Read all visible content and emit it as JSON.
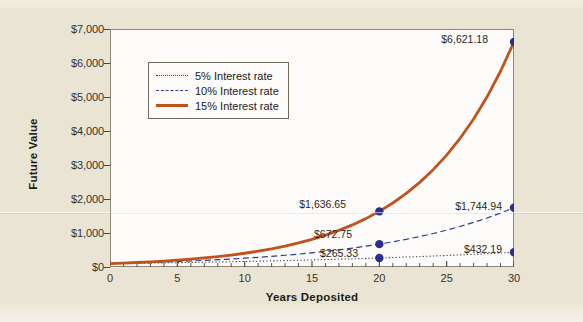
{
  "chart_data": {
    "type": "line",
    "title": "",
    "xlabel": "Years Deposited",
    "ylabel": "Future Value",
    "xlim": [
      0,
      30
    ],
    "ylim": [
      0,
      7000
    ],
    "xticks": [
      0,
      5,
      10,
      15,
      20,
      25,
      30
    ],
    "xtick_labels": [
      "0",
      "5",
      "10",
      "15",
      "20",
      "25",
      "30"
    ],
    "yticks": [
      0,
      1000,
      2000,
      3000,
      4000,
      5000,
      6000,
      7000
    ],
    "ytick_labels": [
      "$0",
      "$1,000",
      "$2,000",
      "$3,000",
      "$4,000",
      "$5,000",
      "$6,000",
      "$7,000"
    ],
    "grid": false,
    "legend_position": "upper left inside",
    "series": [
      {
        "name": "5% Interest rate",
        "rate": 0.05,
        "style": "dotted",
        "color": "#3a3a3a",
        "x": [
          0,
          1,
          2,
          3,
          4,
          5,
          6,
          7,
          8,
          9,
          10,
          11,
          12,
          13,
          14,
          15,
          16,
          17,
          18,
          19,
          20,
          21,
          22,
          23,
          24,
          25,
          26,
          27,
          28,
          29,
          30
        ],
        "values": [
          100,
          105,
          110.25,
          115.76,
          121.55,
          127.63,
          134.01,
          140.71,
          147.75,
          155.13,
          162.89,
          171.03,
          179.59,
          188.56,
          198.0,
          207.89,
          218.29,
          229.2,
          240.66,
          252.7,
          265.33,
          278.6,
          292.53,
          307.15,
          322.51,
          338.64,
          355.57,
          373.35,
          392.01,
          411.61,
          432.19
        ]
      },
      {
        "name": "10% Interest rate",
        "rate": 0.1,
        "style": "dashed",
        "color": "#2f3a95",
        "x": [
          0,
          1,
          2,
          3,
          4,
          5,
          6,
          7,
          8,
          9,
          10,
          11,
          12,
          13,
          14,
          15,
          16,
          17,
          18,
          19,
          20,
          21,
          22,
          23,
          24,
          25,
          26,
          27,
          28,
          29,
          30
        ],
        "values": [
          100,
          110,
          121,
          133.1,
          146.41,
          161.05,
          177.16,
          194.87,
          214.36,
          235.79,
          259.37,
          285.31,
          313.84,
          345.23,
          379.75,
          417.72,
          459.5,
          505.45,
          555.99,
          611.59,
          672.75,
          740.02,
          814.03,
          895.43,
          984.97,
          1083.47,
          1191.82,
          1311.0,
          1442.1,
          1586.31,
          1744.94
        ]
      },
      {
        "name": "15% Interest rate",
        "rate": 0.15,
        "style": "solid",
        "color": "#c2521c",
        "x": [
          0,
          1,
          2,
          3,
          4,
          5,
          6,
          7,
          8,
          9,
          10,
          11,
          12,
          13,
          14,
          15,
          16,
          17,
          18,
          19,
          20,
          21,
          22,
          23,
          24,
          25,
          26,
          27,
          28,
          29,
          30
        ],
        "values": [
          100,
          115,
          132.25,
          152.09,
          174.9,
          201.14,
          231.31,
          266.0,
          305.9,
          351.79,
          404.56,
          465.24,
          535.03,
          615.28,
          707.57,
          813.71,
          935.76,
          1076.13,
          1237.55,
          1423.18,
          1636.65,
          1882.15,
          2164.47,
          2489.14,
          2862.52,
          3291.89,
          3785.68,
          4353.53,
          5006.56,
          5757.54,
          6621.18
        ]
      }
    ],
    "annotations": [
      {
        "label": "$6,621.18",
        "x": 30,
        "y": 6621.18,
        "series": "15% Interest rate",
        "marker": true
      },
      {
        "label": "$1,744.94",
        "x": 30,
        "y": 1744.94,
        "series": "10% Interest rate",
        "marker": true
      },
      {
        "label": "$432.19",
        "x": 30,
        "y": 432.19,
        "series": "5% Interest rate",
        "marker": true
      },
      {
        "label": "$1,636.65",
        "x": 20,
        "y": 1636.65,
        "series": "15% Interest rate",
        "marker": true
      },
      {
        "label": "$672.75",
        "x": 20,
        "y": 672.75,
        "series": "10% Interest rate",
        "marker": true
      },
      {
        "label": "$265.33",
        "x": 20,
        "y": 265.33,
        "series": "5% Interest rate",
        "marker": true
      }
    ],
    "marker_color": "#2a2f8f"
  },
  "legend": {
    "items": [
      {
        "label": "5% Interest rate"
      },
      {
        "label": "10% Interest rate"
      },
      {
        "label": "15% Interest rate"
      }
    ]
  },
  "colors": {
    "page_background": "#e9e4d3",
    "plot_background": "#fdfcfa",
    "axis": "#8d8778",
    "rate5": "#3a3a3a",
    "rate10": "#2f3a95",
    "rate15": "#c2521c",
    "marker": "#2a2f8f",
    "text": "#22201b"
  }
}
